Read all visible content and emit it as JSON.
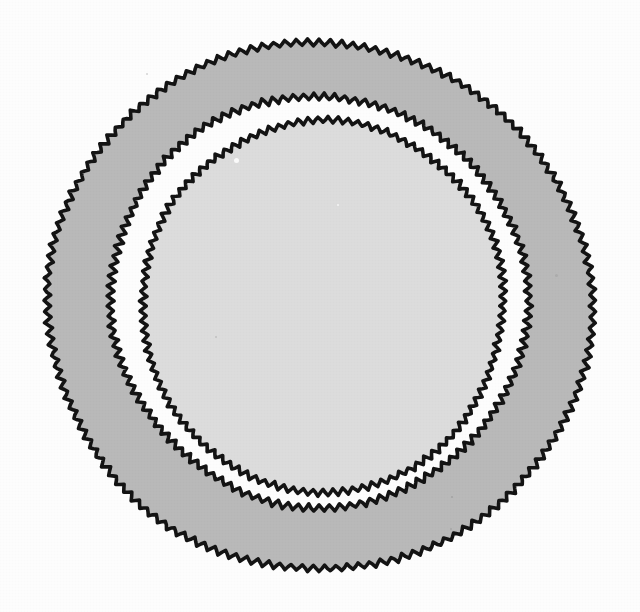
{
  "figure": {
    "title": "Concentric wobbly rings (plate sketch)",
    "kind": "hand-drawn-sketch",
    "canvas": {
      "width": 640,
      "height": 612
    },
    "background_color": "#fdfdfd",
    "stroke_color": "#141414",
    "stroke_width": 3.6,
    "line_style": "sawtooth-jagged-handdrawn",
    "rings": [
      {
        "name": "outer-rim",
        "label": "Outer rim outline",
        "center_x": 319,
        "center_y": 306,
        "radius_x": 271,
        "radius_y": 264,
        "bounds": {
          "left": 48,
          "top": 42,
          "right": 590,
          "bottom": 570
        },
        "fill_color": "#b9b9b9",
        "fill_name": "medium-gray",
        "wobble_amplitude": 3.0,
        "wobble_teeth": 150,
        "drift_amplitude": 5.5
      },
      {
        "name": "middle-band",
        "label": "Middle band outline",
        "center_x": 319,
        "center_y": 301,
        "radius_x": 209,
        "radius_y": 204,
        "bounds": {
          "left": 110,
          "top": 98,
          "right": 528,
          "bottom": 505
        },
        "fill_color": "#fdfdfd",
        "fill_name": "white-gap",
        "wobble_amplitude": 3.2,
        "wobble_teeth": 128,
        "drift_amplitude": 5.0
      },
      {
        "name": "inner-well",
        "label": "Inner well outline",
        "center_x": 323,
        "center_y": 306,
        "radius_x": 182,
        "radius_y": 184,
        "bounds": {
          "left": 142,
          "top": 122,
          "right": 505,
          "bottom": 490
        },
        "fill_color": "#dcdcdc",
        "fill_name": "light-gray",
        "wobble_amplitude": 3.0,
        "wobble_teeth": 116,
        "drift_amplitude": 4.0
      }
    ],
    "speckles": [
      {
        "x": 147,
        "y": 74,
        "size": 2.5,
        "color": "rgba(0,0,0,0.16)"
      },
      {
        "x": 236,
        "y": 160,
        "size": 5.0,
        "color": "rgba(255,255,255,0.85)"
      },
      {
        "x": 216,
        "y": 337,
        "size": 2.0,
        "color": "rgba(0,0,0,0.13)"
      },
      {
        "x": 452,
        "y": 497,
        "size": 2.2,
        "color": "rgba(0,0,0,0.12)"
      },
      {
        "x": 556,
        "y": 275,
        "size": 3.0,
        "color": "rgba(0,0,0,0.07)"
      },
      {
        "x": 451,
        "y": 529,
        "size": 2.0,
        "color": "rgba(0,0,0,0.10)"
      },
      {
        "x": 338,
        "y": 205,
        "size": 2.4,
        "color": "rgba(255,255,255,0.7)"
      }
    ]
  }
}
